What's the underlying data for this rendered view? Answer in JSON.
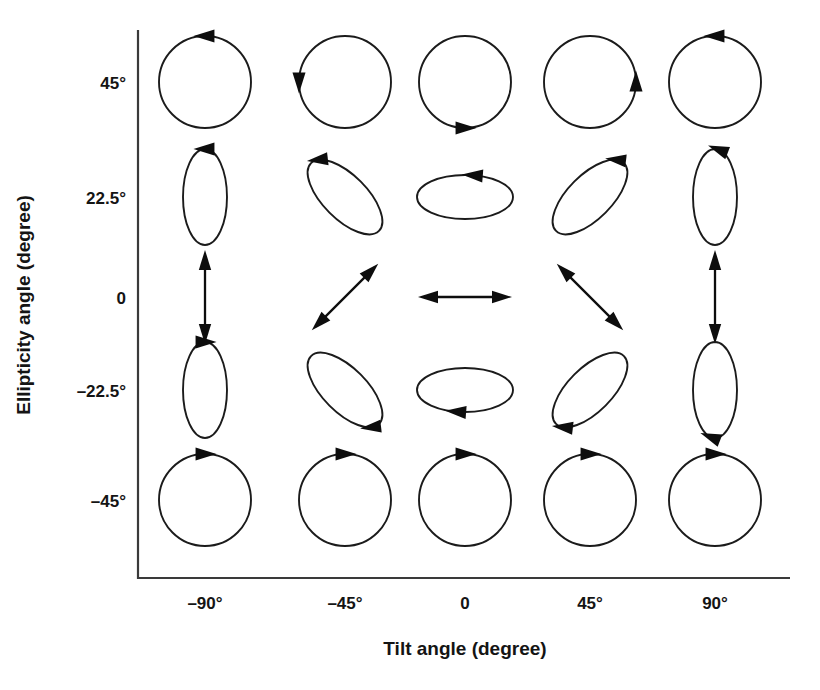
{
  "chart_data": {
    "type": "scatter",
    "title": "",
    "xlabel": "Tilt angle (degree)",
    "ylabel": "Ellipticity angle (degree)",
    "x": [
      -90,
      -45,
      0,
      45,
      90
    ],
    "xticklabels": [
      "–90°",
      "–45°",
      "0",
      "45°",
      "90°"
    ],
    "y": [
      45,
      22.5,
      0,
      -22.5,
      -45
    ],
    "yticklabels": [
      "45°",
      "22.5°",
      "0",
      "–22.5°",
      "–45°"
    ],
    "xlim": [
      -112,
      112
    ],
    "ylim": [
      -56,
      56
    ],
    "grid": false,
    "legend": null,
    "marker_type": "polarization-ellipse",
    "cells": [
      {
        "tilt": -90,
        "ellipticity": 45,
        "shape": "circle",
        "axis_ratio": 1.0,
        "rotation": -90,
        "handedness": "clockwise",
        "arrow_angle_deg": 180
      },
      {
        "tilt": -45,
        "ellipticity": 45,
        "shape": "circle",
        "axis_ratio": 1.0,
        "rotation": -45,
        "handedness": "clockwise",
        "arrow_angle_deg": 135
      },
      {
        "tilt": 0,
        "ellipticity": 45,
        "shape": "circle",
        "axis_ratio": 1.0,
        "rotation": 0,
        "handedness": "clockwise",
        "arrow_angle_deg": 90
      },
      {
        "tilt": 45,
        "ellipticity": 45,
        "shape": "circle",
        "axis_ratio": 1.0,
        "rotation": 45,
        "handedness": "clockwise",
        "arrow_angle_deg": 45
      },
      {
        "tilt": 90,
        "ellipticity": 45,
        "shape": "circle",
        "axis_ratio": 1.0,
        "rotation": 90,
        "handedness": "clockwise",
        "arrow_angle_deg": 0
      },
      {
        "tilt": -90,
        "ellipticity": 22.5,
        "shape": "ellipse",
        "axis_ratio": 0.45,
        "rotation": -90,
        "handedness": "clockwise",
        "arrow_angle_deg": 180
      },
      {
        "tilt": -45,
        "ellipticity": 22.5,
        "shape": "ellipse",
        "axis_ratio": 0.45,
        "rotation": -45,
        "handedness": "clockwise",
        "arrow_angle_deg": 200
      },
      {
        "tilt": 0,
        "ellipticity": 22.5,
        "shape": "ellipse",
        "axis_ratio": 0.45,
        "rotation": 0,
        "handedness": "clockwise",
        "arrow_angle_deg": 280
      },
      {
        "tilt": 45,
        "ellipticity": 22.5,
        "shape": "ellipse",
        "axis_ratio": 0.45,
        "rotation": 45,
        "handedness": "clockwise",
        "arrow_angle_deg": 340
      },
      {
        "tilt": 90,
        "ellipticity": 22.5,
        "shape": "ellipse",
        "axis_ratio": 0.45,
        "rotation": 90,
        "handedness": "clockwise",
        "arrow_angle_deg": 10
      },
      {
        "tilt": -90,
        "ellipticity": 0,
        "shape": "line",
        "axis_ratio": 0.0,
        "rotation": -90,
        "handedness": "linear",
        "arrow_angle_deg": null
      },
      {
        "tilt": -45,
        "ellipticity": 0,
        "shape": "line",
        "axis_ratio": 0.0,
        "rotation": -45,
        "handedness": "linear",
        "arrow_angle_deg": null
      },
      {
        "tilt": 0,
        "ellipticity": 0,
        "shape": "line",
        "axis_ratio": 0.0,
        "rotation": 0,
        "handedness": "linear",
        "arrow_angle_deg": null
      },
      {
        "tilt": 45,
        "ellipticity": 0,
        "shape": "line",
        "axis_ratio": 0.0,
        "rotation": 45,
        "handedness": "linear",
        "arrow_angle_deg": null
      },
      {
        "tilt": 90,
        "ellipticity": 0,
        "shape": "line",
        "axis_ratio": 0.0,
        "rotation": 90,
        "handedness": "linear",
        "arrow_angle_deg": null
      },
      {
        "tilt": -90,
        "ellipticity": -22.5,
        "shape": "ellipse",
        "axis_ratio": 0.45,
        "rotation": -90,
        "handedness": "counterclockwise",
        "arrow_angle_deg": 180
      },
      {
        "tilt": -45,
        "ellipticity": -22.5,
        "shape": "ellipse",
        "axis_ratio": 0.45,
        "rotation": -45,
        "handedness": "counterclockwise",
        "arrow_angle_deg": 20
      },
      {
        "tilt": 0,
        "ellipticity": -22.5,
        "shape": "ellipse",
        "axis_ratio": 0.45,
        "rotation": 0,
        "handedness": "counterclockwise",
        "arrow_angle_deg": 100
      },
      {
        "tilt": 45,
        "ellipticity": -22.5,
        "shape": "ellipse",
        "axis_ratio": 0.45,
        "rotation": 45,
        "handedness": "counterclockwise",
        "arrow_angle_deg": 160
      },
      {
        "tilt": 90,
        "ellipticity": -22.5,
        "shape": "ellipse",
        "axis_ratio": 0.45,
        "rotation": 90,
        "handedness": "counterclockwise",
        "arrow_angle_deg": 190
      },
      {
        "tilt": -90,
        "ellipticity": -45,
        "shape": "circle",
        "axis_ratio": 1.0,
        "rotation": -90,
        "handedness": "counterclockwise",
        "arrow_angle_deg": 180
      },
      {
        "tilt": -45,
        "ellipticity": -45,
        "shape": "circle",
        "axis_ratio": 1.0,
        "rotation": -45,
        "handedness": "counterclockwise",
        "arrow_angle_deg": 225
      },
      {
        "tilt": 0,
        "ellipticity": -45,
        "shape": "circle",
        "axis_ratio": 1.0,
        "rotation": 0,
        "handedness": "counterclockwise",
        "arrow_angle_deg": 270
      },
      {
        "tilt": 45,
        "ellipticity": -45,
        "shape": "circle",
        "axis_ratio": 1.0,
        "rotation": 45,
        "handedness": "counterclockwise",
        "arrow_angle_deg": 315
      },
      {
        "tilt": 90,
        "ellipticity": -45,
        "shape": "circle",
        "axis_ratio": 1.0,
        "rotation": 90,
        "handedness": "counterclockwise",
        "arrow_angle_deg": 0
      }
    ]
  },
  "colors": {
    "stroke": "#1b1b1b",
    "axis": "#3a3a3a",
    "text": "#141414",
    "background": "#ffffff"
  },
  "geometry": {
    "col_centers": [
      205,
      345,
      465,
      590,
      715
    ],
    "row_centers": [
      82,
      197,
      297,
      390,
      500
    ],
    "axis_x": 138,
    "axis_y": 578,
    "axis_right": 790,
    "axis_top": 30,
    "circle_radius": 46,
    "ellipse_major": 48,
    "ellipse_minor": 22,
    "line_half_length": 36
  }
}
